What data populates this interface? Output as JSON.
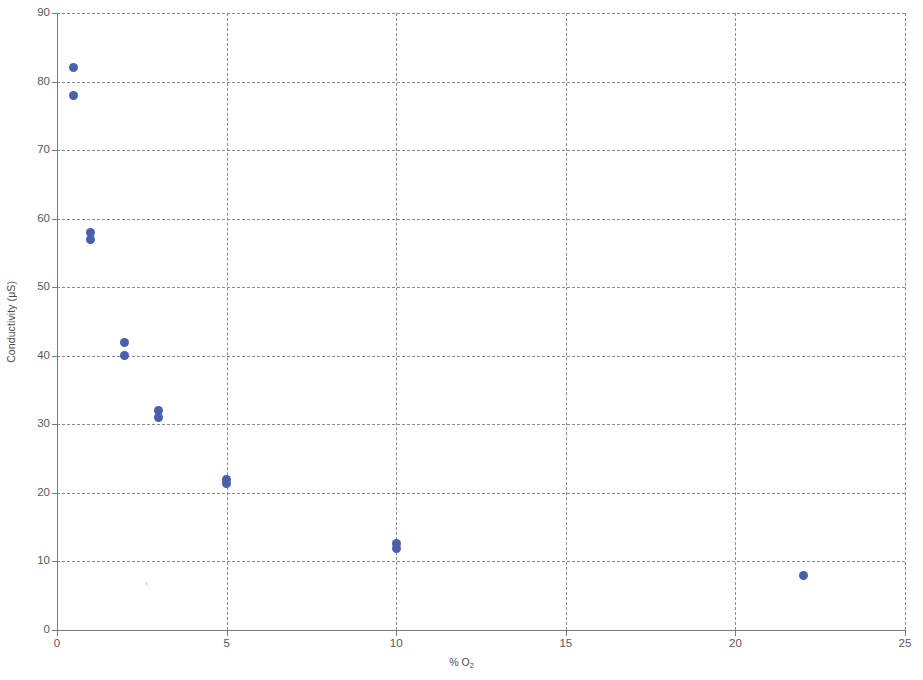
{
  "chart_data": {
    "type": "scatter",
    "title": "",
    "xlabel": "% O2",
    "xlabel_html": "% O<sub>2</sub>",
    "ylabel": "Conductivity (μS)",
    "xlim": [
      0,
      25
    ],
    "ylim": [
      0,
      90
    ],
    "xticks": [
      0,
      5,
      10,
      15,
      20,
      25
    ],
    "yticks": [
      0,
      10,
      20,
      30,
      40,
      50,
      60,
      70,
      80,
      90
    ],
    "xtick_labels": [
      "0",
      "5",
      "10",
      "15",
      "20",
      "25"
    ],
    "ytick_labels": [
      "0",
      "10",
      "20",
      "30",
      "40",
      "50",
      "60",
      "70",
      "80",
      "90"
    ],
    "grid": true,
    "grid_style": "dashed",
    "grid_color": "#8c8c8c",
    "legend": null,
    "marker_color": "#4a5fad",
    "marker_shape": "circle",
    "series": [
      {
        "name": "Conductivity vs % O2",
        "points": [
          {
            "x": 0.5,
            "y": 82
          },
          {
            "x": 0.5,
            "y": 78
          },
          {
            "x": 1.0,
            "y": 58
          },
          {
            "x": 1.0,
            "y": 57
          },
          {
            "x": 2.0,
            "y": 42
          },
          {
            "x": 2.0,
            "y": 40
          },
          {
            "x": 3.0,
            "y": 32
          },
          {
            "x": 3.0,
            "y": 31
          },
          {
            "x": 5.0,
            "y": 22
          },
          {
            "x": 5.0,
            "y": 21.4
          },
          {
            "x": 10.0,
            "y": 12.6
          },
          {
            "x": 10.0,
            "y": 11.9
          },
          {
            "x": 22.0,
            "y": 8
          }
        ]
      }
    ]
  }
}
